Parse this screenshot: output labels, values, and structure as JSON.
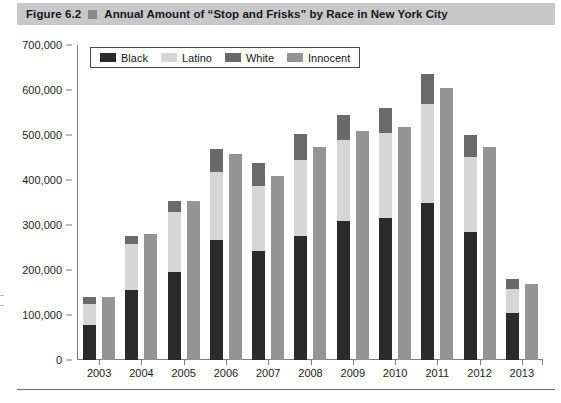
{
  "figure": {
    "number": "Figure 6.2",
    "marker_icon": "square-bullet-icon",
    "title": "Annual Amount of “Stop and Frisks” by Race in New York City"
  },
  "legend": {
    "position": "top-left-inside-plot",
    "items": [
      {
        "label": "Black",
        "color": "#2b2b2b"
      },
      {
        "label": "Latino",
        "color": "#d6d6d6"
      },
      {
        "label": "White",
        "color": "#6a6a6a"
      },
      {
        "label": "Innocent",
        "color": "#949494"
      }
    ]
  },
  "axes": {
    "y_ticks": [
      "700,000",
      "600,000",
      "500,000",
      "400,000",
      "300,000",
      "200,000",
      "100,000",
      "0"
    ],
    "y_tick_values": [
      700000,
      600000,
      500000,
      400000,
      300000,
      200000,
      100000,
      0
    ],
    "y_min": 0,
    "y_max": 700000,
    "x_labels": [
      "2003",
      "2004",
      "2005",
      "2006",
      "2007",
      "2008",
      "2009",
      "2010",
      "2011",
      "2012",
      "2013"
    ]
  },
  "chart_data": {
    "type": "bar",
    "title": "Annual Amount of “Stop and Frisks” by Race in New York City",
    "xlabel": "",
    "ylabel": "",
    "ylim": [
      0,
      700000
    ],
    "grid": false,
    "legend_position": "upper left",
    "stacked_groups": true,
    "note": "Each year shows a stacked bar (Black + Latino + White) beside a separate single bar (Innocent).",
    "categories": [
      "2003",
      "2004",
      "2005",
      "2006",
      "2007",
      "2008",
      "2009",
      "2010",
      "2011",
      "2012",
      "2013"
    ],
    "series": [
      {
        "name": "Black",
        "stack": "race",
        "color": "#2b2b2b",
        "values": [
          78000,
          155000,
          196000,
          267000,
          243000,
          275000,
          310000,
          315000,
          350000,
          284000,
          105000
        ]
      },
      {
        "name": "Latino",
        "stack": "race",
        "color": "#d6d6d6",
        "values": [
          47000,
          103000,
          134000,
          150000,
          144000,
          170000,
          180000,
          190000,
          220000,
          168000,
          53000
        ]
      },
      {
        "name": "White",
        "stack": "race",
        "color": "#6a6a6a",
        "values": [
          15000,
          17000,
          23000,
          51000,
          51000,
          57000,
          55000,
          55000,
          65000,
          48000,
          22000
        ]
      },
      {
        "name": "Innocent",
        "stack": "innocent",
        "color": "#949494",
        "values": [
          140000,
          279000,
          353000,
          457000,
          410000,
          474000,
          510000,
          518000,
          605000,
          473000,
          168000
        ]
      }
    ],
    "stack_totals": [
      140000,
      275000,
      353000,
      468000,
      438000,
      502000,
      545000,
      560000,
      635000,
      500000,
      180000
    ]
  }
}
